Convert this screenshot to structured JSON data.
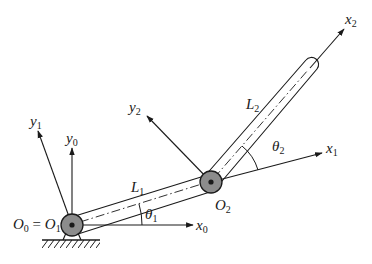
{
  "figure": {
    "colors": {
      "line": "#1a1a1a",
      "joint_fill": "#8c8c8c",
      "background": "#ffffff"
    },
    "labels": {
      "x0": {
        "base": "x",
        "sub": "0"
      },
      "y0": {
        "base": "y",
        "sub": "0"
      },
      "x1": {
        "base": "x",
        "sub": "1"
      },
      "y1": {
        "base": "y",
        "sub": "1"
      },
      "x2": {
        "base": "x",
        "sub": "2"
      },
      "y2": {
        "base": "y",
        "sub": "2"
      },
      "L1": {
        "base": "L",
        "sub": "1"
      },
      "L2": {
        "base": "L",
        "sub": "2"
      },
      "theta1": {
        "base": "θ",
        "sub": "1"
      },
      "theta2": {
        "base": "θ",
        "sub": "2"
      },
      "O2": {
        "base": "O",
        "sub": "2"
      },
      "origin": {
        "a": "O",
        "a_sub": "0",
        "eq": " = ",
        "b": "O",
        "b_sub": "1"
      }
    },
    "joints": [
      {
        "name": "O1",
        "cx": 72,
        "cy": 225
      },
      {
        "name": "O2",
        "cx": 211,
        "cy": 182
      }
    ]
  }
}
